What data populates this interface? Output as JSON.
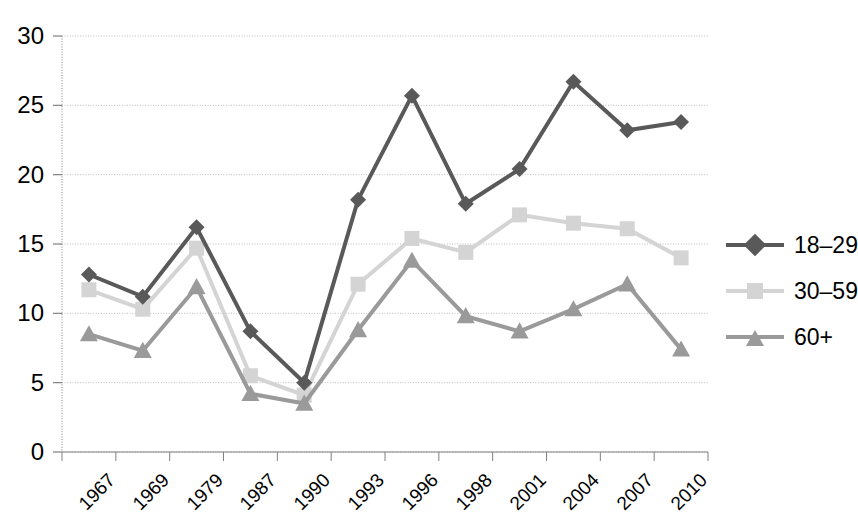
{
  "chart_data": {
    "type": "line",
    "title": "",
    "xlabel": "",
    "ylabel": "",
    "categories": [
      "1967",
      "1969",
      "1979",
      "1987",
      "1990",
      "1993",
      "1996",
      "1998",
      "2001",
      "2004",
      "2007",
      "2010"
    ],
    "ylim": [
      0,
      30
    ],
    "y_ticks": [
      0,
      5,
      10,
      15,
      20,
      25,
      30
    ],
    "grid": true,
    "legend_position": "right",
    "series": [
      {
        "name": "18–29",
        "color": "#595959",
        "marker": "diamond",
        "values": [
          12.8,
          11.2,
          16.2,
          8.7,
          5.0,
          18.2,
          25.7,
          17.9,
          20.4,
          26.7,
          23.2,
          23.8
        ]
      },
      {
        "name": "30–59",
        "color": "#d4d4d4",
        "marker": "square",
        "values": [
          11.7,
          10.3,
          14.7,
          5.5,
          4.1,
          12.1,
          15.4,
          14.4,
          17.1,
          16.5,
          16.1,
          14.0
        ]
      },
      {
        "name": "60+",
        "color": "#9a9a9a",
        "marker": "triangle",
        "values": [
          8.5,
          7.3,
          11.9,
          4.2,
          3.5,
          8.8,
          13.8,
          9.8,
          8.7,
          10.3,
          12.1,
          7.4
        ]
      }
    ]
  },
  "axes": {
    "y_tick_labels": [
      "30",
      "25",
      "20",
      "15",
      "10",
      "5",
      "0"
    ],
    "x_tick_labels": [
      "1967",
      "1969",
      "1979",
      "1987",
      "1990",
      "1993",
      "1996",
      "1998",
      "2001",
      "2004",
      "2007",
      "2010"
    ]
  },
  "legend": {
    "items": [
      {
        "label": "18–29",
        "color": "#595959",
        "marker": "diamond"
      },
      {
        "label": "30–59",
        "color": "#d4d4d4",
        "marker": "square"
      },
      {
        "label": "60+",
        "color": "#9a9a9a",
        "marker": "triangle"
      }
    ]
  },
  "colors": {
    "grid": "#bdbdbd",
    "axis": "#808080",
    "background": "#ffffff",
    "text": "#000000"
  }
}
